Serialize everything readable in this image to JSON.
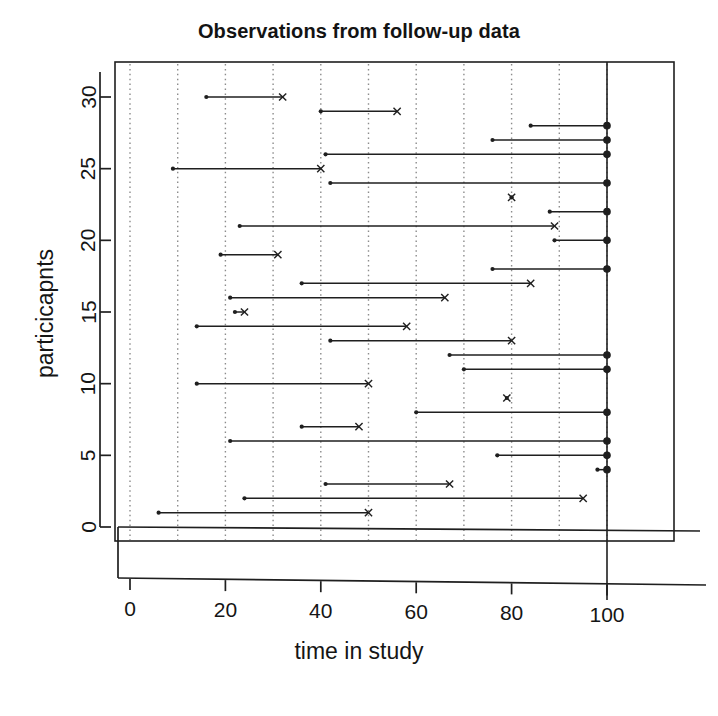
{
  "chart": {
    "title": "Observations from follow-up data",
    "xlabel": "time in study",
    "ylabel": "particicapnts"
  },
  "axes": {
    "x_ticks": [
      "0",
      "20",
      "40",
      "60",
      "80",
      "100"
    ],
    "y_ticks": [
      "0",
      "5",
      "10",
      "15",
      "20",
      "25",
      "30"
    ]
  },
  "chart_data": {
    "type": "line",
    "subtype": "follow-up / survival event-history segments",
    "title": "Observations from follow-up data",
    "xlabel": "time in study",
    "ylabel": "particicapnts",
    "xlim": [
      0,
      104
    ],
    "ylim": [
      -1,
      32
    ],
    "x_ticks": [
      0,
      20,
      40,
      60,
      80,
      100
    ],
    "y_ticks": [
      0,
      5,
      10,
      15,
      20,
      25,
      30
    ],
    "grid": "vertical dotted gridlines every 10 units",
    "grid_x": [
      0,
      10,
      20,
      30,
      40,
      50,
      60,
      70,
      80,
      90,
      100
    ],
    "legend": null,
    "marker_meaning": {
      "start": "filled dot at entry time",
      "x": "x mark = event observed",
      "circle": "open/filled circle at time 100 = censored at end of study"
    },
    "reference_line_x": 100,
    "segments": [
      {
        "id": 30,
        "start": 16,
        "end": 32,
        "end_marker": "x"
      },
      {
        "id": 29,
        "start": 40,
        "end": 56,
        "end_marker": "x"
      },
      {
        "id": 28,
        "start": 84,
        "end": 100,
        "end_marker": "circle"
      },
      {
        "id": 27,
        "start": 76,
        "end": 100,
        "end_marker": "circle"
      },
      {
        "id": 26,
        "start": 41,
        "end": 100,
        "end_marker": "circle"
      },
      {
        "id": 25,
        "start": 9,
        "end": 40,
        "end_marker": "x"
      },
      {
        "id": 24,
        "start": 42,
        "end": 100,
        "end_marker": "circle"
      },
      {
        "id": 23,
        "start": 80,
        "end": 80,
        "end_marker": "x"
      },
      {
        "id": 22,
        "start": 88,
        "end": 100,
        "end_marker": "circle"
      },
      {
        "id": 21,
        "start": 23,
        "end": 89,
        "end_marker": "x"
      },
      {
        "id": 20,
        "start": 89,
        "end": 100,
        "end_marker": "circle"
      },
      {
        "id": 19,
        "start": 19,
        "end": 31,
        "end_marker": "x"
      },
      {
        "id": 18,
        "start": 76,
        "end": 100,
        "end_marker": "circle"
      },
      {
        "id": 17,
        "start": 36,
        "end": 84,
        "end_marker": "x"
      },
      {
        "id": 16,
        "start": 21,
        "end": 66,
        "end_marker": "x"
      },
      {
        "id": 15,
        "start": 22,
        "end": 24,
        "end_marker": "x"
      },
      {
        "id": 14,
        "start": 14,
        "end": 58,
        "end_marker": "x"
      },
      {
        "id": 13,
        "start": 42,
        "end": 80,
        "end_marker": "x"
      },
      {
        "id": 12,
        "start": 67,
        "end": 100,
        "end_marker": "circle"
      },
      {
        "id": 11,
        "start": 70,
        "end": 100,
        "end_marker": "circle"
      },
      {
        "id": 10,
        "start": 14,
        "end": 50,
        "end_marker": "x"
      },
      {
        "id": 9,
        "start": 79,
        "end": 79,
        "end_marker": "x"
      },
      {
        "id": 8,
        "start": 60,
        "end": 100,
        "end_marker": "circle"
      },
      {
        "id": 7,
        "start": 36,
        "end": 48,
        "end_marker": "x"
      },
      {
        "id": 6,
        "start": 21,
        "end": 100,
        "end_marker": "circle"
      },
      {
        "id": 5,
        "start": 77,
        "end": 100,
        "end_marker": "circle"
      },
      {
        "id": 4,
        "start": 98,
        "end": 100,
        "end_marker": "circle"
      },
      {
        "id": 3,
        "start": 41,
        "end": 67,
        "end_marker": "x"
      },
      {
        "id": 2,
        "start": 24,
        "end": 95,
        "end_marker": "x"
      },
      {
        "id": 1,
        "start": 6,
        "end": 50,
        "end_marker": "x"
      }
    ]
  },
  "colors": {
    "line": "#1f1f1f",
    "grid": "#8c8c8c",
    "axis": "#1f1f1f",
    "background": "#ffffff"
  }
}
